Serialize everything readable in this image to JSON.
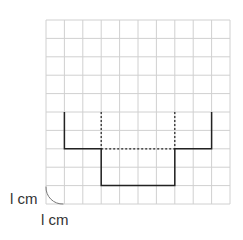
{
  "diagram": {
    "type": "grid-net",
    "grid": {
      "columns": 10,
      "rows": 10,
      "origin_px": [
        46,
        20
      ],
      "cell_px": 18.4,
      "line_color": "#d0d0d0"
    },
    "shape": {
      "solid_path_grid": [
        [
          1,
          5
        ],
        [
          1,
          7
        ],
        [
          3,
          7
        ],
        [
          3,
          9
        ],
        [
          7,
          9
        ],
        [
          7,
          7
        ],
        [
          9,
          7
        ],
        [
          9,
          5
        ]
      ],
      "dashed_segments_grid": [
        [
          [
            3,
            5
          ],
          [
            3,
            7
          ]
        ],
        [
          [
            7,
            5
          ],
          [
            7,
            7
          ]
        ],
        [
          [
            3,
            7
          ],
          [
            7,
            7
          ]
        ]
      ],
      "stroke_color": "#222222"
    },
    "scale": {
      "vertical_label": "l cm",
      "horizontal_label": "l cm"
    }
  }
}
